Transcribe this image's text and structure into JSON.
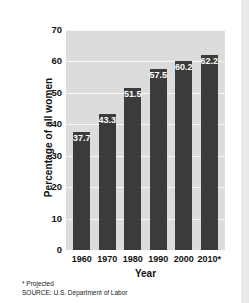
{
  "chart_data": {
    "type": "bar",
    "title": "",
    "categories": [
      "1960",
      "1970",
      "1980",
      "1990",
      "2000",
      "2010*"
    ],
    "values": [
      37.7,
      43.3,
      51.5,
      57.5,
      60.2,
      62.2
    ],
    "value_labels": [
      "37.7",
      "43.3",
      "51.5",
      "57.5",
      "60.2",
      "62.2"
    ],
    "xlabel": "Year",
    "ylabel": "Percentage of all women",
    "ylim": [
      0,
      70
    ],
    "yticks": [
      0,
      10,
      20,
      30,
      40,
      50,
      60,
      70
    ],
    "ytick_labels": [
      "0",
      "10",
      "20",
      "30",
      "40",
      "50",
      "60",
      "70"
    ],
    "grid": true,
    "grid_axis": "y",
    "legend": null,
    "bar_color": "#3b3b3b",
    "plot_background": "#dcdcdc",
    "gridline_color": "#f7f7f7",
    "value_label_color": "#ffffff",
    "annotations": [
      "* Projected",
      "SOURCE: U.S. Department of Labor"
    ]
  },
  "notes": {
    "projected": "* Projected",
    "source": "SOURCE: U.S. Department of Labor"
  }
}
